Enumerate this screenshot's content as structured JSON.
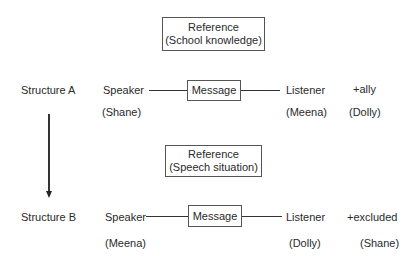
{
  "diagram": {
    "structure_a": {
      "label": "Structure A",
      "reference_box": {
        "line1": "Reference",
        "line2": "(School knowledge)"
      },
      "speaker": {
        "role": "Speaker",
        "name": "(Shane)"
      },
      "message": "Message",
      "listener": {
        "role": "Listener",
        "name": "(Meena)"
      },
      "third_party": {
        "role": "+ally",
        "name": "(Dolly)"
      }
    },
    "structure_b": {
      "label": "Structure B",
      "reference_box": {
        "line1": "Reference",
        "line2": "(Speech situation)"
      },
      "speaker": {
        "role": "Speaker",
        "name": "(Meena)"
      },
      "message": "Message",
      "listener": {
        "role": "Listener",
        "name": "(Dolly)"
      },
      "third_party": {
        "role": "+excluded",
        "name": "(Shane)"
      }
    },
    "transition_arrow": {
      "from": "Structure A",
      "to": "Structure B"
    }
  }
}
